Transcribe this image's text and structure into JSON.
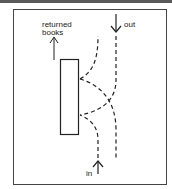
{
  "diagram": {
    "labels": {
      "returned_line1": "returned",
      "returned_line2": "books",
      "out": "out",
      "in": "in"
    },
    "colors": {
      "stroke": "#222222",
      "frame": "#444444",
      "topbar": "#5a5a5a"
    },
    "elements": {
      "desk": "rectangle",
      "paths": [
        "in-path-to-desk",
        "desk-to-out-path",
        "crossing-paths"
      ],
      "arrows": [
        "returned-books-up-arrow",
        "out-down-arrow",
        "in-up-arrow"
      ]
    }
  }
}
